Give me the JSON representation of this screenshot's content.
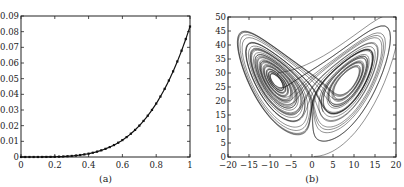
{
  "chart_data": [
    {
      "type": "line",
      "caption": "(a)",
      "title": "",
      "xlabel": "",
      "ylabel": "",
      "xlim": [
        0,
        1
      ],
      "ylim": [
        0,
        0.09
      ],
      "xticks": [
        0,
        0.2,
        0.4,
        0.6,
        0.8,
        1
      ],
      "xtick_labels": [
        "0",
        "0.2",
        "0.4",
        "0.6",
        "0.8",
        "1"
      ],
      "yticks": [
        0,
        0.01,
        0.02,
        0.03,
        0.04,
        0.05,
        0.06,
        0.07,
        0.08,
        0.09
      ],
      "ytick_labels": [
        "0",
        "0.01",
        "0.02",
        "0.03",
        "0.04",
        "0.05",
        "0.06",
        "0.07",
        "0.08",
        "0.09"
      ],
      "grid": false,
      "legend": null,
      "series": [
        {
          "name": "curve",
          "style": "solid line with dense point markers",
          "x": [
            0,
            0.1,
            0.2,
            0.3,
            0.4,
            0.5,
            0.6,
            0.7,
            0.8,
            0.9,
            1.0
          ],
          "y": [
            0,
            1e-05,
            0.00013,
            0.00068,
            0.00213,
            0.00521,
            0.0108,
            0.02,
            0.0341,
            0.0547,
            0.0833
          ]
        }
      ]
    },
    {
      "type": "line",
      "caption": "(b)",
      "title": "",
      "xlabel": "",
      "ylabel": "",
      "xlim": [
        -20,
        20
      ],
      "ylim": [
        0,
        50
      ],
      "xticks": [
        -20,
        -15,
        -10,
        -5,
        0,
        5,
        10,
        15,
        20
      ],
      "xtick_labels": [
        "−20",
        "−15",
        "−10",
        "−5",
        "0",
        "5",
        "10",
        "15",
        "20"
      ],
      "yticks": [
        0,
        5,
        10,
        15,
        20,
        25,
        30,
        35,
        40,
        45,
        50
      ],
      "ytick_labels": [
        "0",
        "5",
        "10",
        "15",
        "20",
        "25",
        "30",
        "35",
        "40",
        "45",
        "50"
      ],
      "grid": false,
      "legend": null,
      "description": "Lorenz attractor trajectory projected on x-z plane (butterfly shape), two lobes centered near (-8.5, 27) and (8.5, 27)",
      "series": [
        {
          "name": "lorenz-trajectory",
          "left_lobe_center": [
            -8.5,
            27
          ],
          "right_lobe_center": [
            8.5,
            27
          ],
          "x_range": [
            -17,
            19
          ],
          "z_range": [
            0,
            48
          ]
        }
      ]
    }
  ]
}
